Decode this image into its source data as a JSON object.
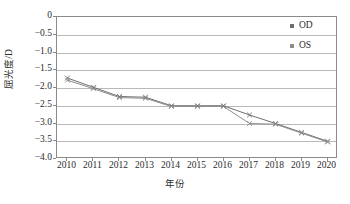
{
  "chart_data": {
    "type": "line",
    "title": "",
    "xlabel": "年份",
    "ylabel": "屈光度/D",
    "x": [
      2010,
      2011,
      2012,
      2013,
      2014,
      2015,
      2016,
      2017,
      2018,
      2019,
      2020
    ],
    "xlim": [
      2009.6,
      2020.4
    ],
    "ylim": [
      -4.0,
      0
    ],
    "yticks": [
      "0",
      "−0.5",
      "−1.0",
      "−1.5",
      "−2.0",
      "−2.5",
      "−3.0",
      "−3.5",
      "−4.0"
    ],
    "ytick_values": [
      0,
      -0.5,
      -1.0,
      -1.5,
      -2.0,
      -2.5,
      -3.0,
      -3.5,
      -4.0
    ],
    "xticks": [
      "2010",
      "2011",
      "2012",
      "2013",
      "2014",
      "2015",
      "2016",
      "2017",
      "2018",
      "2019",
      "2020"
    ],
    "grid": "horizontal",
    "legend_position": "top-right",
    "series": [
      {
        "name": "OD",
        "color": "#6e6e6e",
        "marker": "x",
        "values": [
          -1.72,
          -1.98,
          -2.24,
          -2.26,
          -2.5,
          -2.5,
          -2.5,
          -2.76,
          -3.0,
          -3.25,
          -3.5
        ]
      },
      {
        "name": "OS",
        "color": "#8c8c8c",
        "marker": "x",
        "values": [
          -1.78,
          -2.02,
          -2.27,
          -2.29,
          -2.52,
          -2.52,
          -2.52,
          -3.0,
          -3.02,
          -3.27,
          -3.52
        ]
      }
    ]
  },
  "legend": {
    "items": [
      {
        "label": "OD",
        "color": "#6e6e6e"
      },
      {
        "label": "OS",
        "color": "#8c8c8c"
      }
    ]
  },
  "axes": {
    "frame_color": "#8a8a8a",
    "grid_color": "#b9b9b9",
    "tick_text_color": "#2b2b2b"
  }
}
